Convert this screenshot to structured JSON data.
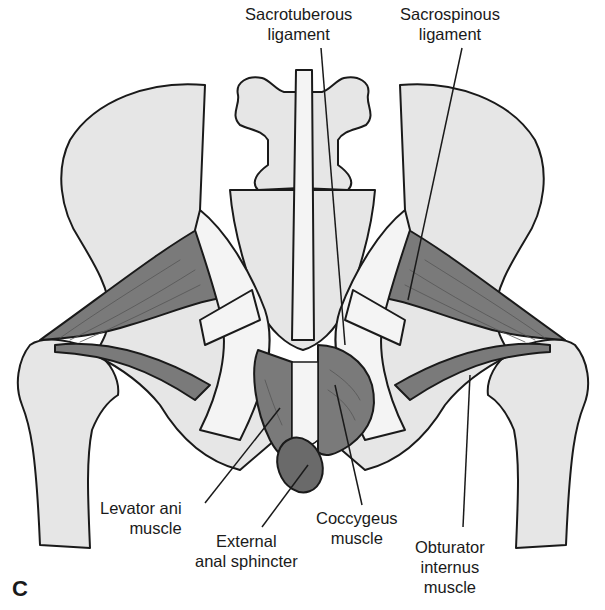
{
  "figure": {
    "panel_letter": "C",
    "colors": {
      "bone": "#e6e6e6",
      "muscle": "#7a7a7a",
      "muscle_dark": "#6a6a6a",
      "ligament": "#f4f4f4",
      "outline": "#1a1a1a",
      "background": "#ffffff"
    }
  },
  "labels": {
    "sacrotuberous": {
      "line1": "Sacrotuberous",
      "line2": "ligament"
    },
    "sacrospinous": {
      "line1": "Sacrospinous",
      "line2": "ligament"
    },
    "levator_ani": {
      "line1": "Levator ani",
      "line2": "muscle"
    },
    "external_anal": {
      "line1": "External",
      "line2": "anal sphincter"
    },
    "coccygeus": {
      "line1": "Coccygeus",
      "line2": "muscle"
    },
    "obturator": {
      "line1": "Obturator",
      "line2": "internus",
      "line3": "muscle"
    }
  }
}
